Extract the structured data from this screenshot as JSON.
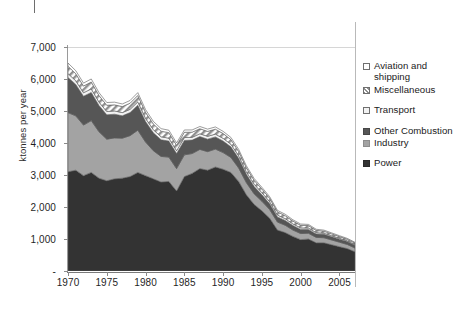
{
  "chart_data": {
    "type": "area",
    "stacked": true,
    "title": "",
    "xlabel": "",
    "ylabel": "ktonnes per year",
    "xlim": [
      1970,
      2007
    ],
    "ylim": [
      0,
      7000
    ],
    "grid": true,
    "legend_position": "right",
    "x": [
      1970,
      1971,
      1972,
      1973,
      1974,
      1975,
      1976,
      1977,
      1978,
      1979,
      1980,
      1981,
      1982,
      1983,
      1984,
      1985,
      1986,
      1987,
      1988,
      1989,
      1990,
      1991,
      1992,
      1993,
      1994,
      1995,
      1996,
      1997,
      1998,
      1999,
      2000,
      2001,
      2002,
      2003,
      2004,
      2005,
      2006,
      2007
    ],
    "y_ticks": [
      "-",
      "1,000",
      "2,000",
      "3,000",
      "4,000",
      "5,000",
      "6,000",
      "7,000"
    ],
    "y_tick_values": [
      0,
      1000,
      2000,
      3000,
      4000,
      5000,
      6000,
      7000
    ],
    "x_ticks": [
      "1970",
      "1975",
      "1980",
      "1985",
      "1990",
      "1995",
      "2000",
      "2005"
    ],
    "x_tick_values": [
      1970,
      1975,
      1980,
      1985,
      1990,
      1995,
      2000,
      2005
    ],
    "series": [
      {
        "name": "Power",
        "color": "#333333",
        "pattern": "solid",
        "values": [
          3100,
          3150,
          2980,
          3080,
          2900,
          2820,
          2880,
          2900,
          2950,
          3080,
          2980,
          2880,
          2780,
          2800,
          2500,
          2950,
          3050,
          3200,
          3150,
          3250,
          3180,
          3080,
          2800,
          2380,
          2080,
          1880,
          1650,
          1280,
          1200,
          1080,
          980,
          1000,
          880,
          880,
          820,
          760,
          700,
          600
        ]
      },
      {
        "name": "Industry",
        "color": "#a3a3a3",
        "pattern": "solid",
        "values": [
          1850,
          1700,
          1580,
          1620,
          1450,
          1300,
          1280,
          1250,
          1280,
          1320,
          1050,
          880,
          800,
          760,
          700,
          680,
          620,
          600,
          580,
          560,
          520,
          470,
          420,
          380,
          330,
          300,
          270,
          250,
          230,
          200,
          190,
          180,
          170,
          160,
          150,
          140,
          130,
          120
        ]
      },
      {
        "name": "Other Combustion",
        "color": "#565656",
        "pattern": "solid",
        "values": [
          1100,
          980,
          900,
          880,
          820,
          760,
          740,
          700,
          720,
          780,
          640,
          560,
          520,
          500,
          470,
          450,
          420,
          400,
          390,
          380,
          360,
          330,
          300,
          260,
          230,
          200,
          180,
          160,
          150,
          140,
          130,
          120,
          110,
          105,
          100,
          95,
          90,
          85
        ]
      },
      {
        "name": "Transport",
        "color": "#f2f2f2",
        "pattern": "solid",
        "values": [
          120,
          115,
          110,
          112,
          108,
          104,
          102,
          100,
          102,
          106,
          100,
          96,
          94,
          92,
          90,
          90,
          88,
          88,
          88,
          88,
          86,
          84,
          80,
          76,
          72,
          68,
          64,
          60,
          56,
          52,
          48,
          44,
          40,
          36,
          32,
          28,
          26,
          24
        ]
      },
      {
        "name": "Miscellaneous",
        "color": "#c9c9c9",
        "pattern": "hatch",
        "values": [
          230,
          220,
          210,
          215,
          205,
          195,
          190,
          188,
          192,
          200,
          190,
          180,
          176,
          172,
          168,
          165,
          160,
          158,
          156,
          154,
          150,
          145,
          138,
          130,
          122,
          115,
          108,
          100,
          94,
          88,
          82,
          76,
          70,
          64,
          58,
          52,
          48,
          44
        ]
      },
      {
        "name": "Aviation and shipping",
        "color": "#ffffff",
        "pattern": "solid",
        "values": [
          100,
          96,
          92,
          94,
          90,
          86,
          84,
          82,
          84,
          88,
          84,
          80,
          78,
          76,
          74,
          72,
          70,
          70,
          70,
          70,
          68,
          66,
          64,
          60,
          56,
          52,
          50,
          46,
          44,
          40,
          38,
          36,
          34,
          32,
          30,
          28,
          26,
          24
        ]
      }
    ]
  },
  "legend": {
    "items": [
      {
        "label": "Aviation and shipping",
        "swatch": "aviation"
      },
      {
        "label": "Miscellaneous",
        "swatch": "miscellaneous"
      },
      {
        "label": "Transport",
        "swatch": "transport"
      },
      {
        "label": "Other Combustion",
        "swatch": "other"
      },
      {
        "label": "Industry",
        "swatch": "industry"
      },
      {
        "label": "Power",
        "swatch": "power"
      }
    ]
  },
  "axis": {
    "y_label": "ktonnes per year"
  },
  "caption": ""
}
